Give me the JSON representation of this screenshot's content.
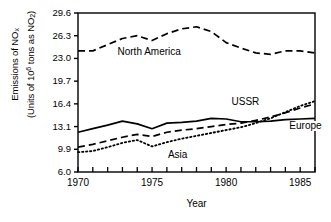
{
  "chart_data": {
    "type": "line",
    "title": "",
    "xlabel": "Year",
    "ylabel_line1": "Emissions of NO",
    "ylabel_line1_sub": "x",
    "ylabel_line2_pre": "(Units of 10",
    "ylabel_line2_sup": "6",
    "ylabel_line2_post": " tons as NO",
    "ylabel_line2_sub": "2",
    "ylabel_line2_end": ")",
    "xlim": [
      1970,
      1986
    ],
    "ylim": [
      6.0,
      29.6
    ],
    "grid": false,
    "legend_position": "inline-annotations",
    "ytick_labels": [
      "29.6",
      "26.3",
      "23.0",
      "19.7",
      "16.4",
      "13.1",
      "9.9",
      "6.0"
    ],
    "ytick_values": [
      29.6,
      26.3,
      23.0,
      19.7,
      16.4,
      13.1,
      9.9,
      6.0
    ],
    "xtick_labels": [
      "1970",
      "1975",
      "1980",
      "1985"
    ],
    "xtick_values": [
      1970,
      1975,
      1980,
      1985
    ],
    "xtick_minor_values": [
      1971,
      1972,
      1973,
      1974,
      1976,
      1977,
      1978,
      1979,
      1981,
      1982,
      1983,
      1984,
      1986
    ],
    "x": [
      1970,
      1971,
      1972,
      1973,
      1974,
      1975,
      1976,
      1977,
      1978,
      1979,
      1980,
      1981,
      1982,
      1983,
      1984,
      1985,
      1986
    ],
    "series": [
      {
        "name": "North America",
        "style": "dashed",
        "color": "#000000",
        "label_x": 1972.6,
        "label_y": 23.9,
        "values": [
          24.1,
          24.1,
          25.0,
          25.9,
          26.3,
          25.6,
          26.6,
          27.3,
          27.6,
          26.9,
          25.3,
          24.5,
          23.8,
          23.6,
          24.1,
          24.1,
          23.8
        ]
      },
      {
        "name": "Europe",
        "style": "solid",
        "color": "#000000",
        "label_x": 1984.2,
        "label_y": 13.2,
        "values": [
          12.3,
          12.8,
          13.3,
          13.9,
          13.5,
          12.8,
          13.6,
          13.7,
          13.9,
          14.3,
          14.2,
          13.8,
          13.8,
          13.9,
          14.1,
          14.2,
          14.3
        ]
      },
      {
        "name": "USSR",
        "style": "dashed",
        "color": "#000000",
        "label_x": 1980.3,
        "label_y": 16.6,
        "values": [
          10.2,
          10.6,
          11.1,
          11.6,
          12.0,
          11.7,
          12.3,
          12.6,
          12.8,
          13.1,
          13.4,
          13.6,
          14.0,
          14.5,
          15.1,
          15.8,
          16.4
        ]
      },
      {
        "name": "Asia",
        "style": "dotted",
        "color": "#000000",
        "label_x": 1976.0,
        "label_y": 9.0,
        "values": [
          9.4,
          9.6,
          10.2,
          10.8,
          11.2,
          10.3,
          10.9,
          11.4,
          11.8,
          12.2,
          12.6,
          13.0,
          13.6,
          14.3,
          15.2,
          16.1,
          16.8
        ]
      }
    ]
  }
}
